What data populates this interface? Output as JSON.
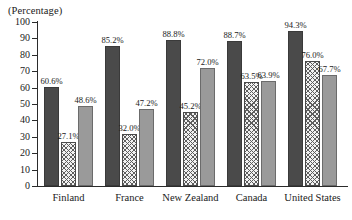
{
  "chart_data": {
    "type": "bar",
    "title": "(Percentage)",
    "xlabel": "",
    "ylabel": "",
    "ylim": [
      0,
      100
    ],
    "ytick_step": 10,
    "yticks": [
      "0",
      "10",
      "20",
      "30",
      "40",
      "50",
      "60",
      "70",
      "80",
      "90",
      "100"
    ],
    "grid": false,
    "legend": "none",
    "categories": [
      "Finland",
      "France",
      "New Zealand",
      "Canada",
      "United States"
    ],
    "series": [
      {
        "name": "series-1",
        "style": "dark-solid",
        "color": "#4a4a4a",
        "values": [
          60.6,
          85.2,
          88.8,
          88.7,
          94.3
        ],
        "labels": [
          "60.6%",
          "85.2%",
          "88.8%",
          "88.7%",
          "94.3%"
        ]
      },
      {
        "name": "series-2",
        "style": "diamond-hatch",
        "color": "#f2f2f2",
        "values": [
          27.1,
          32.0,
          45.2,
          63.5,
          76.0
        ],
        "labels": [
          "27.1%",
          "32.0%",
          "45.2%",
          "63.5%",
          "76.0%"
        ]
      },
      {
        "name": "series-3",
        "style": "mid-gray-solid",
        "color": "#9a9a9a",
        "values": [
          48.6,
          47.2,
          72.0,
          63.9,
          67.7
        ],
        "labels": [
          "48.6%",
          "47.2%",
          "72.0%",
          "63.9%",
          "67.7%"
        ]
      }
    ]
  }
}
